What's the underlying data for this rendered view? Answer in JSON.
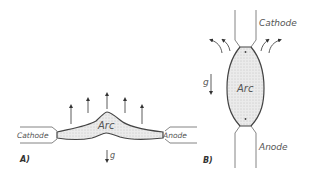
{
  "panels": [
    {
      "id": "A",
      "panel_label": "A)",
      "arc_label": "Arc",
      "cathode_label": "Cathode",
      "anode_label": "Anode",
      "gravity_label": "g",
      "orientation": "horizontal",
      "upward_arrow_count": 5
    },
    {
      "id": "B",
      "panel_label": "B)",
      "arc_label": "Arc",
      "cathode_label": "Cathode",
      "anode_label": "Anode",
      "gravity_label": "g",
      "orientation": "vertical",
      "curved_arrow_count": 4
    }
  ],
  "colors": {
    "outline": "#444444",
    "arc_fill": "#e6e6e6",
    "text": "#555555"
  }
}
